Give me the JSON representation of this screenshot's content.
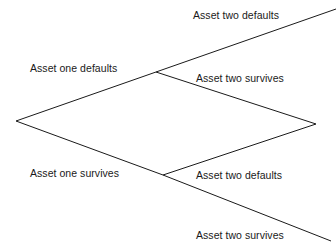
{
  "diagram": {
    "type": "binomial-tree",
    "stroke_color": "#1a1a1a",
    "background_color": "#ffffff",
    "text_color": "#1a1a1a",
    "nodes": {
      "root": {
        "x": 16,
        "y": 121
      },
      "asset_one_defaults": {
        "x": 156,
        "y": 72
      },
      "asset_one_survives": {
        "x": 163,
        "y": 175
      },
      "recombining": {
        "x": 316,
        "y": 124
      }
    },
    "labels": [
      {
        "id": "asset-two-defaults-upper",
        "text": "Asset two defaults",
        "x": 193,
        "y": 9
      },
      {
        "id": "asset-one-defaults",
        "text": "Asset one defaults",
        "x": 30,
        "y": 62
      },
      {
        "id": "asset-two-survives-upper",
        "text": "Asset two survives",
        "x": 196,
        "y": 72
      },
      {
        "id": "asset-one-survives",
        "text": "Asset one survives",
        "x": 30,
        "y": 167
      },
      {
        "id": "asset-two-defaults-lower",
        "text": "Asset two defaults",
        "x": 196,
        "y": 169
      },
      {
        "id": "asset-two-survives-lower",
        "text": "Asset two survives",
        "x": 196,
        "y": 229
      }
    ],
    "edges": [
      {
        "id": "root-to-upper",
        "from": "root",
        "to": "asset_one_defaults",
        "label": "Asset one defaults"
      },
      {
        "id": "root-to-lower",
        "from": "root",
        "to": "asset_one_survives",
        "label": "Asset one survives"
      },
      {
        "id": "upper-to-terminal-up",
        "from": "asset_one_defaults",
        "to": "off-canvas-top-right",
        "label": "Asset two defaults"
      },
      {
        "id": "upper-to-recombining",
        "from": "asset_one_defaults",
        "to": "recombining",
        "label": "Asset two survives"
      },
      {
        "id": "lower-to-recombining",
        "from": "asset_one_survives",
        "to": "recombining",
        "label": "Asset two defaults"
      },
      {
        "id": "lower-to-terminal-down",
        "from": "asset_one_survives",
        "to": "off-canvas-bottom-right",
        "label": "Asset two survives"
      }
    ]
  }
}
